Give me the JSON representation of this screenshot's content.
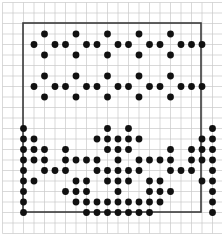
{
  "figure": {
    "title": "",
    "background_color": "#ffffff",
    "grid": {
      "visible": true,
      "line_color": "#c9c9c9",
      "minor_line_color": "#dcdcdc",
      "pitch_px": 10.5,
      "origin_x_px": 13.0,
      "origin_y_px": 13.0,
      "cols": 19,
      "rows": 20
    },
    "border_box": {
      "visible": true,
      "color": "#3a3a3a",
      "width_px": 1.6,
      "x_px": 23.0,
      "y_px": 23.0,
      "w_px": 178.0,
      "h_px": 189.0
    },
    "marker": {
      "shape": "circle",
      "color": "#111111",
      "radius_px": 3.4
    }
  },
  "chart_data": {
    "type": "scatter",
    "title": "",
    "xlabel": "",
    "ylabel": "",
    "grid": true,
    "legend": "none",
    "xlim": [
      0,
      19
    ],
    "ylim": [
      0,
      20
    ],
    "n_points": 146,
    "points": [
      [
        2,
        1
      ],
      [
        1,
        2
      ],
      [
        3,
        2
      ],
      [
        2,
        3
      ],
      [
        5,
        1
      ],
      [
        4,
        2
      ],
      [
        6,
        2
      ],
      [
        5,
        3
      ],
      [
        8,
        1
      ],
      [
        7,
        2
      ],
      [
        9,
        2
      ],
      [
        8,
        3
      ],
      [
        11,
        1
      ],
      [
        10,
        2
      ],
      [
        12,
        2
      ],
      [
        11,
        3
      ],
      [
        14,
        1
      ],
      [
        13,
        2
      ],
      [
        15,
        2
      ],
      [
        14,
        3
      ],
      [
        17,
        2
      ],
      [
        16,
        2
      ],
      [
        2,
        5
      ],
      [
        1,
        6
      ],
      [
        3,
        6
      ],
      [
        2,
        7
      ],
      [
        5,
        5
      ],
      [
        4,
        6
      ],
      [
        6,
        6
      ],
      [
        5,
        7
      ],
      [
        8,
        5
      ],
      [
        7,
        6
      ],
      [
        9,
        6
      ],
      [
        8,
        7
      ],
      [
        11,
        5
      ],
      [
        10,
        6
      ],
      [
        12,
        6
      ],
      [
        11,
        7
      ],
      [
        14,
        5
      ],
      [
        13,
        6
      ],
      [
        15,
        6
      ],
      [
        14,
        7
      ],
      [
        17,
        6
      ],
      [
        16,
        6
      ],
      [
        0,
        10
      ],
      [
        18,
        10
      ],
      [
        0,
        11
      ],
      [
        1,
        11
      ],
      [
        17,
        11
      ],
      [
        18,
        11
      ],
      [
        0,
        12
      ],
      [
        1,
        12
      ],
      [
        2,
        12
      ],
      [
        16,
        12
      ],
      [
        17,
        12
      ],
      [
        18,
        12
      ],
      [
        0,
        13
      ],
      [
        1,
        13
      ],
      [
        2,
        13
      ],
      [
        16,
        13
      ],
      [
        17,
        13
      ],
      [
        18,
        13
      ],
      [
        0,
        14
      ],
      [
        2,
        14
      ],
      [
        16,
        14
      ],
      [
        18,
        14
      ],
      [
        0,
        15
      ],
      [
        1,
        15
      ],
      [
        17,
        15
      ],
      [
        18,
        15
      ],
      [
        0,
        16
      ],
      [
        18,
        16
      ],
      [
        0,
        17
      ],
      [
        18,
        17
      ],
      [
        0,
        18
      ],
      [
        18,
        18
      ],
      [
        4,
        12
      ],
      [
        4,
        13
      ],
      [
        5,
        13
      ],
      [
        3,
        14
      ],
      [
        4,
        14
      ],
      [
        5,
        15
      ],
      [
        6,
        15
      ],
      [
        4,
        16
      ],
      [
        5,
        16
      ],
      [
        6,
        16
      ],
      [
        5,
        17
      ],
      [
        6,
        17
      ],
      [
        7,
        17
      ],
      [
        8,
        17
      ],
      [
        14,
        12
      ],
      [
        14,
        13
      ],
      [
        13,
        13
      ],
      [
        14,
        14
      ],
      [
        15,
        14
      ],
      [
        12,
        15
      ],
      [
        13,
        15
      ],
      [
        12,
        16
      ],
      [
        13,
        16
      ],
      [
        14,
        16
      ],
      [
        10,
        17
      ],
      [
        11,
        17
      ],
      [
        12,
        17
      ],
      [
        13,
        17
      ],
      [
        8,
        10
      ],
      [
        10,
        10
      ],
      [
        7,
        11
      ],
      [
        8,
        11
      ],
      [
        9,
        11
      ],
      [
        10,
        11
      ],
      [
        11,
        11
      ],
      [
        8,
        12
      ],
      [
        9,
        12
      ],
      [
        10,
        12
      ],
      [
        9,
        13
      ],
      [
        9,
        14
      ],
      [
        8,
        15
      ],
      [
        9,
        15
      ],
      [
        10,
        15
      ],
      [
        9,
        16
      ],
      [
        9,
        17
      ],
      [
        6,
        13
      ],
      [
        7,
        13
      ],
      [
        11,
        13
      ],
      [
        12,
        13
      ],
      [
        7,
        14
      ],
      [
        8,
        14
      ],
      [
        10,
        14
      ],
      [
        11,
        14
      ],
      [
        6,
        18
      ],
      [
        7,
        18
      ],
      [
        8,
        18
      ],
      [
        9,
        18
      ],
      [
        10,
        18
      ],
      [
        11,
        18
      ],
      [
        12,
        18
      ]
    ]
  }
}
